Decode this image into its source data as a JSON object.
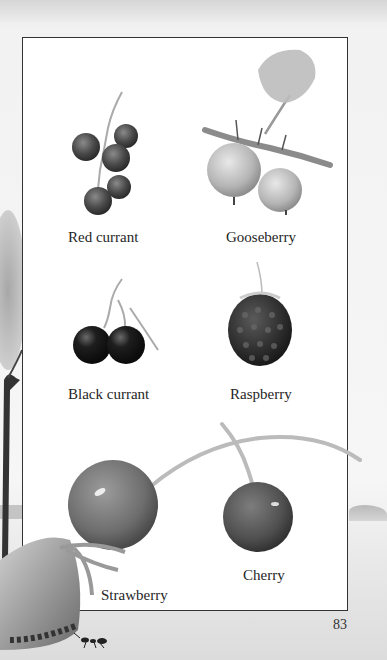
{
  "page": {
    "number": "83",
    "style": "grayscale illustrated book page"
  },
  "fruits": [
    {
      "name": "Red currant"
    },
    {
      "name": "Gooseberry"
    },
    {
      "name": "Black currant"
    },
    {
      "name": "Raspberry"
    },
    {
      "name": "Cherry"
    },
    {
      "name": "Strawberry"
    }
  ],
  "icons": {
    "tree": "tree-illustration",
    "ant": "ant-illustration"
  },
  "colors": {
    "frame_border": "#333333",
    "frame_fill": "#ffffff",
    "page_background": "#eeeeee",
    "text": "#262626"
  }
}
